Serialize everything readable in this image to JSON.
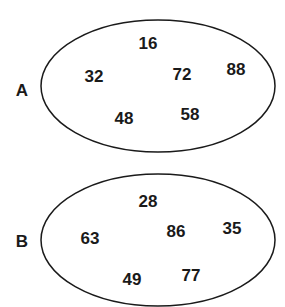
{
  "sets": [
    {
      "name": "A",
      "ellipse": {
        "cx": 158,
        "cy": 86,
        "rx": 117,
        "ry": 67
      },
      "label_pos": {
        "x": 22,
        "y": 90
      },
      "elements": [
        {
          "value": "16",
          "x": 148,
          "y": 43
        },
        {
          "value": "32",
          "x": 94,
          "y": 76
        },
        {
          "value": "72",
          "x": 182,
          "y": 74
        },
        {
          "value": "88",
          "x": 236,
          "y": 69
        },
        {
          "value": "48",
          "x": 124,
          "y": 118
        },
        {
          "value": "58",
          "x": 190,
          "y": 114
        }
      ]
    },
    {
      "name": "B",
      "ellipse": {
        "cx": 158,
        "cy": 240,
        "rx": 117,
        "ry": 67
      },
      "label_pos": {
        "x": 22,
        "y": 241
      },
      "elements": [
        {
          "value": "28",
          "x": 148,
          "y": 201
        },
        {
          "value": "63",
          "x": 90,
          "y": 238
        },
        {
          "value": "86",
          "x": 176,
          "y": 231
        },
        {
          "value": "35",
          "x": 232,
          "y": 228
        },
        {
          "value": "49",
          "x": 132,
          "y": 279
        },
        {
          "value": "77",
          "x": 191,
          "y": 275
        }
      ]
    }
  ],
  "colors": {
    "stroke": "#1a1a1a",
    "text": "#1a1a1a",
    "background": "#ffffff"
  }
}
